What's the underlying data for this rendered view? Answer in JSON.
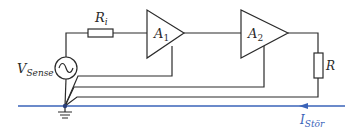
{
  "diagram": {
    "source": {
      "label": "V",
      "subscript": "Sense",
      "symbol": "sine-wave"
    },
    "input_resistor": {
      "label": "R",
      "subscript": "i"
    },
    "amplifier1": {
      "label": "A",
      "subscript": "1"
    },
    "amplifier2": {
      "label": "A",
      "subscript": "2"
    },
    "load_resistor": {
      "label": "R"
    },
    "disturbance_current": {
      "label": "I",
      "subscript": "Stör",
      "direction": "left"
    },
    "colors": {
      "wire": "#2b2b2b",
      "ground_line": "#3a63b8"
    }
  }
}
